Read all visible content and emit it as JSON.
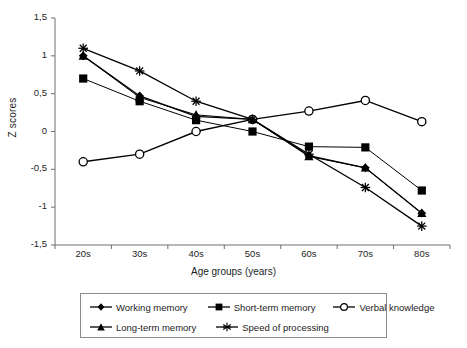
{
  "chart_data": {
    "type": "line",
    "title": "",
    "xlabel": "Age groups (years)",
    "ylabel": "Z scores",
    "categories": [
      "20s",
      "30s",
      "40s",
      "50s",
      "60s",
      "70s",
      "80s"
    ],
    "ylim": [
      -1.5,
      1.5
    ],
    "ytick_labels": [
      "1,5",
      "1",
      "0,5",
      "0",
      "-0,5",
      "-1",
      "-1,5"
    ],
    "ytick_values": [
      1.5,
      1.0,
      0.5,
      0.0,
      -0.5,
      -1.0,
      -1.5
    ],
    "grid": false,
    "legend_position": "bottom",
    "series": [
      {
        "name": "Working memory",
        "marker": "filled-diamond",
        "color": "#000000",
        "values": [
          1.0,
          0.47,
          0.2,
          0.16,
          -0.32,
          -0.48,
          -1.08
        ]
      },
      {
        "name": "Short-term memory",
        "marker": "filled-square",
        "color": "#000000",
        "values": [
          0.7,
          0.4,
          0.15,
          0.0,
          -0.2,
          -0.21,
          -0.78
        ]
      },
      {
        "name": "Verbal knowledge",
        "marker": "open-circle",
        "color": "#000000",
        "values": [
          -0.4,
          -0.3,
          0.0,
          0.16,
          0.27,
          0.41,
          0.13
        ]
      },
      {
        "name": "Long-term memory",
        "marker": "filled-triangle",
        "color": "#000000",
        "values": [
          1.0,
          0.45,
          0.22,
          0.16,
          -0.33,
          -0.48,
          -1.08
        ]
      },
      {
        "name": "Speed of processing",
        "marker": "star",
        "color": "#000000",
        "values": [
          1.1,
          0.8,
          0.4,
          0.16,
          -0.3,
          -0.74,
          -1.25
        ]
      }
    ]
  },
  "axes": {
    "y_title": "Z scores",
    "x_title": "Age groups (years)"
  },
  "legend": {
    "entries": [
      "Working memory",
      "Short-term memory",
      "Verbal knowledge",
      "Long-term memory",
      "Speed of processing"
    ]
  }
}
